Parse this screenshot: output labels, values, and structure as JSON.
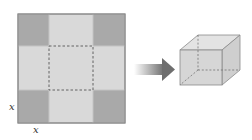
{
  "diagram": {
    "labels": {
      "side_vertical": "x",
      "side_horizontal": "x"
    },
    "colors": {
      "corner": "#a9a9a9",
      "flap": "#d9d9d9",
      "base": "#d9d9d9",
      "border": "#8a8a8a",
      "fold_line": "#555555",
      "arrow": "#7a7a7a",
      "box_face": "#d4d4d4"
    }
  }
}
